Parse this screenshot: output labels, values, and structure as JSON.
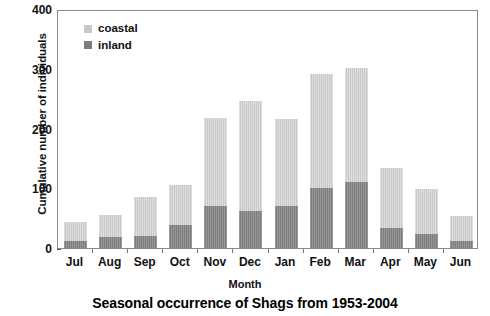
{
  "chart_data": {
    "type": "bar",
    "subtype": "stacked-bar",
    "title": "Seasonal occurrence of Shags from 1953-2004",
    "xlabel": "Month",
    "ylabel": "Cumulative number of individuals",
    "categories": [
      "Jul",
      "Aug",
      "Sep",
      "Oct",
      "Nov",
      "Dec",
      "Jan",
      "Feb",
      "Mar",
      "Apr",
      "May",
      "Jun"
    ],
    "series": [
      {
        "name": "inland",
        "values": [
          12,
          18,
          20,
          38,
          71,
          62,
          70,
          100,
          110,
          33,
          23,
          11
        ],
        "color": "#7d7d7d"
      },
      {
        "name": "coastal",
        "values": [
          32,
          37,
          65,
          67,
          146,
          184,
          146,
          191,
          192,
          101,
          75,
          43
        ],
        "color": "#c9c9c9"
      }
    ],
    "totals": [
      44,
      55,
      85,
      105,
      217,
      246,
      216,
      291,
      302,
      134,
      98,
      54
    ],
    "ylim": [
      0,
      400
    ],
    "yticks": [
      0,
      100,
      200,
      300,
      400
    ],
    "ytick_labels": [
      "0",
      "100",
      "200",
      "300",
      "400"
    ],
    "grid": false,
    "legend_position": "top-left",
    "legend_entries": [
      {
        "label": "coastal",
        "color": "#c9c9c9"
      },
      {
        "label": "inland",
        "color": "#7d7d7d"
      }
    ]
  }
}
